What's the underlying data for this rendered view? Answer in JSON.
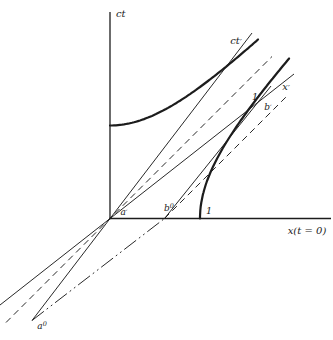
{
  "figure": {
    "background_color": "#ffffff",
    "ink_color": "#1c1c1c",
    "axes": {
      "ct_axis": {
        "from": [
          110,
          12
        ],
        "to": [
          110,
          219.2
        ],
        "width": 1.3
      },
      "x_axis": {
        "from": [
          109.3,
          218.5
        ],
        "to": [
          331,
          218.5
        ],
        "width": 1.3
      }
    },
    "lines": [
      {
        "name": "ct-prime-axis",
        "from": [
          32,
          320.5
        ],
        "to": [
          252,
          33
        ],
        "style": "solid",
        "width": 0.95
      },
      {
        "name": "x-prime-axis",
        "from": [
          0,
          305
        ],
        "to": [
          294,
          74
        ],
        "style": "solid",
        "width": 0.95
      },
      {
        "name": "b-worldline",
        "from": [
          164.5,
          218.5
        ],
        "to": [
          271,
          86
        ],
        "style": "solid",
        "width": 0.95
      },
      {
        "name": "light-ray-origin",
        "from": [
          6,
          322.5
        ],
        "to": [
          272,
          56.5
        ],
        "style": "dashed",
        "width": 0.95
      },
      {
        "name": "light-ray-b0",
        "from": [
          164.5,
          218.5
        ],
        "to": [
          286,
          97
        ],
        "style": "dashed",
        "width": 0.95
      },
      {
        "name": "a0-b0-simultaneity",
        "from": [
          32,
          320.5
        ],
        "to": [
          164.5,
          218.5
        ],
        "style": "dashdot",
        "width": 0.95
      }
    ],
    "dash_patterns": {
      "solid": "",
      "dashed": "6.5,4.5",
      "dashdot": "15,3.5,1.8,3.5,1.8,3.5"
    },
    "hyperbolas": [
      {
        "name": "time-calibration-hyperbola",
        "branch": "time",
        "center": [
          110,
          218.5
        ],
        "unit_x": 90,
        "unit_y": 93,
        "x_from": 110,
        "x_to": 259,
        "width": 2.2
      },
      {
        "name": "space-calibration-hyperbola",
        "branch": "space",
        "center": [
          110,
          218.5
        ],
        "unit_x": 90,
        "unit_y": 93,
        "y_from": 218.5,
        "y_to": 58,
        "width": 2.2
      }
    ],
    "labels": [
      {
        "name": "ct-axis-label",
        "text": "ct",
        "x": 116,
        "y": 17,
        "anchor": "start",
        "size": 10
      },
      {
        "name": "ct-prime-axis-label",
        "text": "ct",
        "prime": true,
        "x": 236,
        "y": 44,
        "anchor": "middle",
        "size": 10
      },
      {
        "name": "x-prime-axis-label",
        "text": "x",
        "prime": true,
        "x": 286,
        "y": 90,
        "anchor": "middle",
        "size": 10
      },
      {
        "name": "x-axis-label",
        "text": "x(t = 0)",
        "x": 307,
        "y": 234,
        "anchor": "middle",
        "size": 10
      },
      {
        "name": "a-prime-label",
        "text": "a",
        "prime": true,
        "x": 124,
        "y": 215,
        "anchor": "middle",
        "size": 9
      },
      {
        "name": "b0-label",
        "text": "b",
        "sup": "0",
        "x": 169,
        "y": 211,
        "anchor": "middle",
        "size": 9
      },
      {
        "name": "unit-x-label",
        "text": "1",
        "x": 209,
        "y": 214,
        "anchor": "middle",
        "size": 9.5
      },
      {
        "name": "unit-xprime-label",
        "text": "1",
        "x": 255,
        "y": 100,
        "anchor": "middle",
        "size": 9.5
      },
      {
        "name": "b-prime-label",
        "text": "b",
        "prime": true,
        "x": 268,
        "y": 110,
        "anchor": "middle",
        "size": 9
      },
      {
        "name": "a0-label",
        "text": "a",
        "sup": "0",
        "x": 42,
        "y": 329,
        "anchor": "middle",
        "size": 9
      }
    ]
  }
}
